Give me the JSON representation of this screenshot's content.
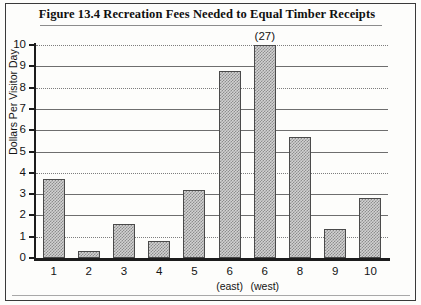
{
  "figure": {
    "title": "Figure 13.4   Recreation Fees Needed to Equal Timber Receipts"
  },
  "chart_data": {
    "type": "bar",
    "title": "Figure 13.4   Recreation Fees Needed to Equal Timber Receipts",
    "xlabel": "",
    "ylabel": "Dollars Per Visitor Day",
    "ylim": [
      0,
      10
    ],
    "yticks": [
      0,
      1,
      2,
      3,
      4,
      5,
      6,
      7,
      8,
      9,
      10
    ],
    "ytick_labels": [
      "0",
      "1",
      "2",
      "3",
      "4",
      "5",
      "6",
      "7",
      "8",
      "9",
      "10"
    ],
    "grid": true,
    "grid_axis": "y",
    "legend": "none",
    "categories": [
      "1",
      "2",
      "3",
      "4",
      "5",
      "6",
      "6",
      "8",
      "9",
      "10"
    ],
    "category_sublabels": [
      "",
      "",
      "",
      "",
      "",
      "(east)",
      "(west)",
      "",
      "",
      ""
    ],
    "values": [
      3.7,
      0.35,
      1.6,
      0.8,
      3.2,
      8.8,
      27,
      5.7,
      1.35,
      2.8
    ],
    "clipped": [
      false,
      false,
      false,
      false,
      false,
      false,
      true,
      false,
      false,
      false
    ],
    "annotations": [
      {
        "category_index": 6,
        "text": "(27)",
        "note": "bar extends beyond axis maximum of 10"
      }
    ]
  },
  "axis": {
    "y_title": "Dollars Per Visitor Day"
  }
}
